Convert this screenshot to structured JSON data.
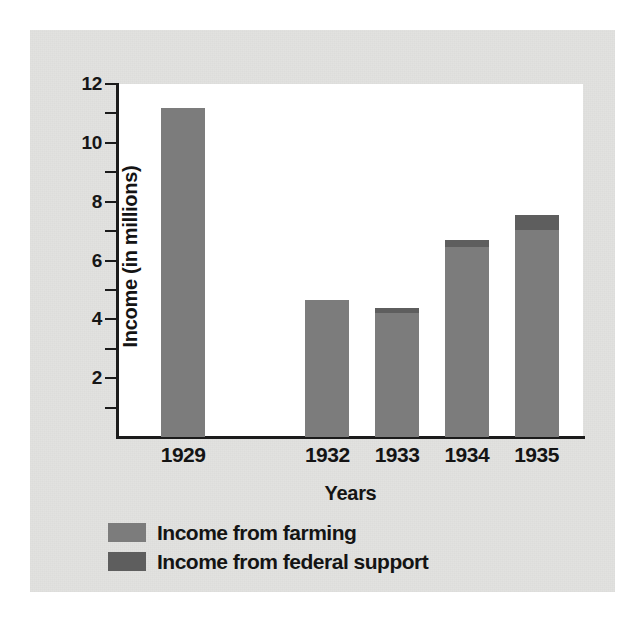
{
  "chart_data": {
    "type": "bar",
    "title": "",
    "xlabel": "Years",
    "ylabel": "Income (in millions)",
    "categories": [
      "1929",
      "1932",
      "1933",
      "1934",
      "1935"
    ],
    "ylim": [
      0,
      12
    ],
    "yticks_major": [
      2,
      4,
      6,
      8,
      10,
      12
    ],
    "yticks_minor": [
      1,
      3,
      5,
      7,
      9,
      11
    ],
    "ytick_labels": [
      "2",
      "4",
      "6",
      "8",
      "10",
      "12"
    ],
    "grid": false,
    "legend_position": "below-axis-left",
    "stacked": true,
    "series": [
      {
        "name": "Income from farming",
        "color": "#7c7c7c",
        "values": [
          11.2,
          4.65,
          4.2,
          6.45,
          7.05
        ]
      },
      {
        "name": "Income from federal support",
        "color": "#5e5e5e",
        "values": [
          0,
          0,
          0.2,
          0.25,
          0.5
        ]
      }
    ],
    "totals": [
      11.2,
      4.65,
      4.4,
      6.7,
      7.55
    ],
    "bar_positions_pct": [
      14,
      45,
      60,
      75,
      90
    ]
  },
  "legend": {
    "items": [
      {
        "label": "Income from farming",
        "swatch": "#7c7c7c"
      },
      {
        "label": "Income from federal support",
        "swatch": "#5e5e5e"
      }
    ]
  },
  "colors": {
    "card_background": "#e2e2e0",
    "plot_background": "#ffffff",
    "axis": "#1b1b1b",
    "text": "#141414",
    "farming": "#7c7c7c",
    "federal_support": "#5e5e5e"
  }
}
